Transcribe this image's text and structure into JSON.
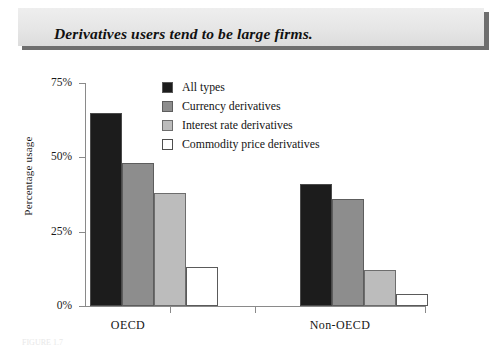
{
  "title": {
    "text": "Derivatives users tend to be large firms."
  },
  "bottom_caption": {
    "text": "FIGURE 1.7"
  },
  "colors": {
    "all_types": "#1c1c1c",
    "currency": "#8d8d8d",
    "interest_rate": "#bcbcbc",
    "commodity": "#ffffff",
    "axis": "#8a8a8a",
    "banner_shadow": "#6f6f6f",
    "banner_fill": "#e6e6e6"
  },
  "legend": {
    "position": "top-center",
    "items": [
      {
        "label": "All types",
        "color": "#1c1c1c",
        "swatch": "c-black"
      },
      {
        "label": "Currency derivatives",
        "color": "#8d8d8d",
        "swatch": "c-dark"
      },
      {
        "label": "Interest rate derivatives",
        "color": "#bcbcbc",
        "swatch": "c-light"
      },
      {
        "label": "Commodity price derivatives",
        "color": "#ffffff",
        "swatch": "c-white"
      }
    ]
  },
  "axes": {
    "y_title": "Percentage usage",
    "y_ticks": [
      "0%",
      "25%",
      "50%",
      "75%"
    ],
    "y_tick_values": [
      0,
      25,
      50,
      75
    ],
    "x_categories": [
      "OECD",
      "Non-OECD"
    ]
  },
  "chart_data": {
    "type": "bar",
    "title": "Derivatives users tend to be large firms.",
    "xlabel": "",
    "ylabel": "Percentage usage",
    "ylim": [
      0,
      75
    ],
    "ytick_labels": [
      "0%",
      "25%",
      "50%",
      "75%"
    ],
    "grid": false,
    "legend_position": "top-center",
    "categories": [
      "OECD",
      "Non-OECD"
    ],
    "series": [
      {
        "name": "All types",
        "color": "#1c1c1c",
        "values": [
          65,
          41
        ]
      },
      {
        "name": "Currency derivatives",
        "color": "#8d8d8d",
        "values": [
          48,
          36
        ]
      },
      {
        "name": "Interest rate derivatives",
        "color": "#bcbcbc",
        "values": [
          38,
          12
        ]
      },
      {
        "name": "Commodity price derivatives",
        "color": "#ffffff",
        "values": [
          13,
          4
        ]
      }
    ]
  }
}
